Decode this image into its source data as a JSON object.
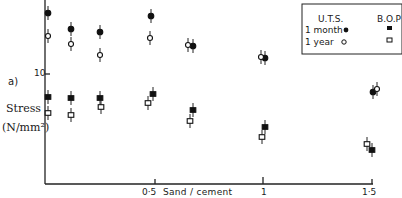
{
  "chart_data": {
    "type": "scatter",
    "panel_label": "a)",
    "title": "",
    "xlabel": "Sand / cement",
    "ylabel": "Stress (N/mm²)",
    "ylabel_line1": "Stress",
    "ylabel_line2": "(N/mm²)",
    "x_ticks": [
      {
        "value": 0.5,
        "label": "0·5"
      },
      {
        "value": 1,
        "label": "1"
      },
      {
        "value": 1.5,
        "label": "1·5"
      }
    ],
    "y_ticks": [
      {
        "value": 10,
        "label": "10"
      }
    ],
    "xlim": [
      0,
      1.5
    ],
    "grid": false,
    "error_bars": true,
    "legend": {
      "position": "top-right",
      "header_left": "U.T.S.",
      "header_right": "B.O.P",
      "rows": [
        {
          "label": "1 month",
          "uts_marker": "filled-circle",
          "bop_marker": "filled-square"
        },
        {
          "label": "1 year",
          "uts_marker": "open-circle",
          "bop_marker": "open-square"
        }
      ]
    },
    "x": [
      0,
      0.1,
      0.25,
      0.48,
      0.67,
      1.0,
      1.5
    ],
    "series": [
      {
        "name": "U.T.S. 1 month",
        "marker": "filled-circle",
        "values": [
          16.1,
          14.5,
          14.2,
          15.8,
          12.8,
          11.6,
          8.2
        ],
        "x": [
          0,
          0.1,
          0.25,
          0.48,
          0.68,
          1.01,
          1.5
        ]
      },
      {
        "name": "U.T.S. 1 year",
        "marker": "open-circle",
        "values": [
          13.8,
          13.0,
          11.9,
          13.6,
          12.9,
          11.7,
          8.5
        ],
        "x": [
          0,
          0.1,
          0.25,
          0.48,
          0.66,
          0.99,
          1.51
        ]
      },
      {
        "name": "B.O.P 1 month",
        "marker": "filled-square",
        "values": [
          7.7,
          7.6,
          7.6,
          8.0,
          6.4,
          4.7,
          2.4
        ],
        "x": [
          0,
          0.1,
          0.25,
          0.49,
          0.68,
          1.0,
          1.5
        ]
      },
      {
        "name": "B.O.P 1 year",
        "marker": "open-square",
        "values": [
          6.1,
          5.9,
          6.7,
          7.1,
          5.3,
          3.7,
          3.0
        ],
        "x": [
          0,
          0.1,
          0.25,
          0.47,
          0.67,
          0.99,
          1.49
        ]
      }
    ],
    "pixel_map": {
      "x0_px": 47,
      "x_per_unit_px": 216,
      "y10_px": 74,
      "y_per_unit_px": 10
    },
    "points_px": {
      "uts_month": [
        [
          48,
          13
        ],
        [
          71,
          29
        ],
        [
          100,
          32
        ],
        [
          151,
          16
        ],
        [
          193,
          46
        ],
        [
          265,
          58
        ],
        [
          373,
          92
        ]
      ],
      "uts_year": [
        [
          48,
          36
        ],
        [
          71,
          44
        ],
        [
          100,
          55
        ],
        [
          150,
          38
        ],
        [
          188,
          45
        ],
        [
          261,
          57
        ],
        [
          377,
          89
        ]
      ],
      "bop_month": [
        [
          48,
          97
        ],
        [
          71,
          98
        ],
        [
          100,
          98
        ],
        [
          153,
          94
        ],
        [
          193,
          110
        ],
        [
          265,
          127
        ],
        [
          372,
          150
        ]
      ],
      "bop_year": [
        [
          48,
          113
        ],
        [
          71,
          115
        ],
        [
          101,
          107
        ],
        [
          148,
          103
        ],
        [
          190,
          121
        ],
        [
          262,
          137
        ],
        [
          367,
          144
        ]
      ]
    }
  },
  "labels": {
    "panel": "a)",
    "y_tick_10": "10",
    "stress": "Stress",
    "units": "(N/mm²)",
    "x_tick_05": "0·5",
    "x_title": "Sand / cement",
    "x_tick_1": "1",
    "x_tick_15": "1·5",
    "legend_uts": "U.T.S.",
    "legend_bop": "B.O.P",
    "legend_month": "1 month",
    "legend_year": "1 year"
  }
}
